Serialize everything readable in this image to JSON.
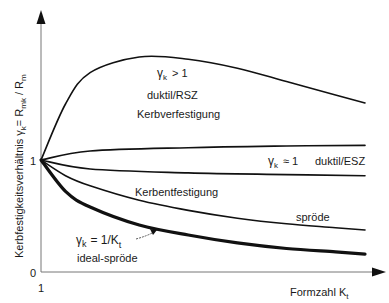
{
  "chart_data": {
    "type": "line",
    "title": "",
    "xlabel": "Formzahl K",
    "xlabel_sub": "t",
    "ylabel": "Kerbfestigkeitsverhältnis γ",
    "ylabel_sub": "k",
    "ylabel_eq": "= R",
    "ylabel_eq_sub": "mk",
    "ylabel_tail": "/ R",
    "ylabel_tail_sub": "m",
    "x_tick_labels": [
      "1"
    ],
    "y_tick_labels": [
      "0",
      "1"
    ],
    "y_ticks": [
      0,
      1
    ],
    "xlim": [
      1,
      8
    ],
    "ylim": [
      0,
      2.5
    ],
    "grid": false,
    "series": [
      {
        "name": "duktil/RSZ (Kerbverfestigung)",
        "x": [
          1,
          1.5,
          2,
          3,
          4,
          5,
          6,
          7,
          7.6
        ],
        "values": [
          1,
          1.5,
          1.78,
          1.92,
          1.9,
          1.82,
          1.7,
          1.58,
          1.51
        ]
      },
      {
        "name": "duktil/ESZ upper",
        "x": [
          1,
          2,
          4,
          6,
          7.6
        ],
        "values": [
          1,
          1.08,
          1.11,
          1.125,
          1.13
        ]
      },
      {
        "name": "duktil/ESZ lower",
        "x": [
          1,
          2,
          4,
          6,
          7.6
        ],
        "values": [
          1,
          0.92,
          0.885,
          0.87,
          0.86
        ]
      },
      {
        "name": "spröde (Kerbentfestigung)",
        "x": [
          1,
          1.5,
          2,
          3,
          4,
          5,
          6,
          7,
          7.6
        ],
        "values": [
          1,
          0.86,
          0.77,
          0.64,
          0.55,
          0.48,
          0.43,
          0.395,
          0.375
        ]
      },
      {
        "name": "ideal-spröde (γk = 1/Kt)",
        "x": [
          1,
          1.5,
          2,
          3,
          4,
          5,
          6,
          7,
          7.6
        ],
        "values": [
          1,
          0.72,
          0.58,
          0.42,
          0.33,
          0.26,
          0.21,
          0.18,
          0.16
        ]
      }
    ],
    "annotations": [
      {
        "text": "γk > 1",
        "sym": "γ",
        "sub": "k",
        "rest": "> 1"
      },
      {
        "text": "duktil/RSZ"
      },
      {
        "text": "Kerbverfestigung"
      },
      {
        "text": "γk ≈ 1",
        "sym": "γ",
        "sub": "k",
        "rest": "≈ 1"
      },
      {
        "text": "duktil/ESZ"
      },
      {
        "text": "Kerbentfestigung"
      },
      {
        "text": "spröde"
      },
      {
        "text": "γk = 1/Kt",
        "sym": "γ",
        "sub": "k",
        "rest": "= 1/K",
        "sub2": "t"
      },
      {
        "text": "ideal-spröde"
      }
    ],
    "legend": "none"
  }
}
